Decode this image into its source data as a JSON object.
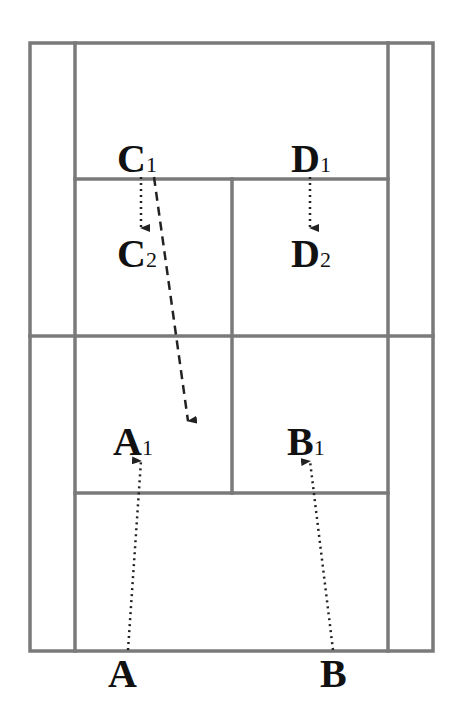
{
  "diagram": {
    "type": "badminton-court-positions",
    "colors": {
      "court_lines": "#7a7a7a",
      "labels": "#111111",
      "arrows": "#222222",
      "background": "#ffffff"
    },
    "court": {
      "outer": {
        "x1": 30,
        "y1": 43,
        "x2": 433,
        "y2": 651
      },
      "side_lines_x": [
        75,
        388
      ],
      "net_y": 336,
      "top_service_y": 179,
      "bottom_service_y": 493,
      "center_line_x": 232
    },
    "labels": [
      {
        "id": "C1",
        "letter": "C",
        "sub": "1",
        "x": 117,
        "y": 172
      },
      {
        "id": "D1",
        "letter": "D",
        "sub": "1",
        "x": 291,
        "y": 172
      },
      {
        "id": "C2",
        "letter": "C",
        "sub": "2",
        "x": 117,
        "y": 267
      },
      {
        "id": "D2",
        "letter": "D",
        "sub": "2",
        "x": 291,
        "y": 267
      },
      {
        "id": "A1",
        "letter": "A",
        "sub": "1",
        "x": 113,
        "y": 455
      },
      {
        "id": "B1",
        "letter": "B",
        "sub": "1",
        "x": 287,
        "y": 455
      },
      {
        "id": "A",
        "letter": "A",
        "sub": "",
        "x": 108,
        "y": 687
      },
      {
        "id": "B",
        "letter": "B",
        "sub": "",
        "x": 320,
        "y": 687
      }
    ],
    "arrows": [
      {
        "from": "C1",
        "to": "C2",
        "style": "dotted",
        "x1": 141,
        "y1": 177,
        "x2": 141,
        "y2": 228
      },
      {
        "from": "D1",
        "to": "D2",
        "style": "dotted",
        "x1": 310,
        "y1": 177,
        "x2": 310,
        "y2": 228
      },
      {
        "from": "C1",
        "to": "A1-area",
        "style": "dashed",
        "x1": 154,
        "y1": 177,
        "x2": 188,
        "y2": 421
      },
      {
        "from": "A",
        "to": "A1",
        "style": "dotted",
        "x1": 128,
        "y1": 650,
        "x2": 141,
        "y2": 461
      },
      {
        "from": "B",
        "to": "B1",
        "style": "dotted",
        "x1": 333,
        "y1": 650,
        "x2": 310,
        "y2": 461
      }
    ]
  }
}
